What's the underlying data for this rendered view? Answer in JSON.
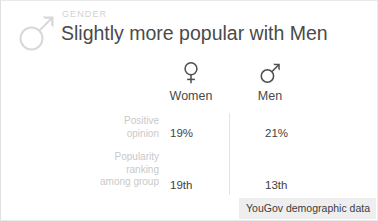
{
  "card": {
    "eyebrow": "GENDER",
    "title": "Slightly more popular with Men",
    "header_icon": "mars-symbol-icon"
  },
  "columns": [
    {
      "key": "women",
      "label": "Women",
      "icon": "venus-symbol-icon"
    },
    {
      "key": "men",
      "label": "Men",
      "icon": "mars-symbol-icon"
    }
  ],
  "rows": [
    {
      "label_lines": [
        "Positive",
        "opinion"
      ],
      "label": "Positive opinion",
      "women": "19%",
      "men": "21%"
    },
    {
      "label_lines": [
        "Popularity",
        "ranking",
        "among group"
      ],
      "label": "Popularity ranking among group",
      "women": "19th",
      "men": "13th"
    }
  ],
  "footer": {
    "source_label": "YouGov demographic data"
  },
  "colors": {
    "title_text": "#4a4a4a",
    "muted_text": "#c9c9c9",
    "value_text": "#3f3f3f",
    "divider": "#e3e3e3",
    "badge_bg": "#eeeeee",
    "header_icon": "#d8d8d8"
  }
}
